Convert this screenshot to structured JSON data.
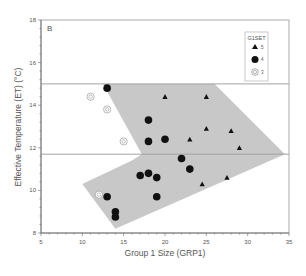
{
  "chart_data": {
    "type": "scatter",
    "panel_label": "B",
    "title": "",
    "xlabel": "Group 1 Size (GRP1)",
    "ylabel": "Effective Temperature (ET) (°C)",
    "xlim": [
      5,
      35
    ],
    "ylim": [
      8,
      18
    ],
    "x_ticks": [
      5,
      10,
      15,
      20,
      25,
      30,
      35
    ],
    "y_ticks": [
      8,
      10,
      12,
      14,
      16,
      18
    ],
    "grid": false,
    "reference_lines_y": [
      15,
      11.7
    ],
    "legend": {
      "title": "G1SET",
      "position": "upper right",
      "entries": [
        {
          "label": "5",
          "marker": "triangle"
        },
        {
          "label": "4",
          "marker": "filled-circle"
        },
        {
          "label": "3",
          "marker": "target-circle"
        }
      ]
    },
    "shaded_regions": [
      {
        "name": "upper-region",
        "points": [
          [
            12.5,
            15
          ],
          [
            26,
            15
          ],
          [
            34.5,
            11.7
          ],
          [
            17.2,
            11.7
          ]
        ]
      },
      {
        "name": "lower-region",
        "points": [
          [
            10,
            10.3
          ],
          [
            14,
            8.2
          ],
          [
            34.5,
            11.7
          ],
          [
            17.2,
            11.7
          ],
          [
            16,
            11.4
          ]
        ]
      }
    ],
    "series": [
      {
        "name": "5",
        "marker": "triangle",
        "points": [
          [
            20,
            14.4
          ],
          [
            25,
            14.4
          ],
          [
            25,
            12.9
          ],
          [
            28,
            12.8
          ],
          [
            23,
            12.4
          ],
          [
            29,
            12.0
          ],
          [
            27.5,
            10.6
          ],
          [
            24.5,
            10.3
          ]
        ]
      },
      {
        "name": "4",
        "marker": "filled-circle",
        "points": [
          [
            13,
            14.8
          ],
          [
            18,
            13.3
          ],
          [
            18,
            12.3
          ],
          [
            20,
            12.4
          ],
          [
            22,
            11.5
          ],
          [
            23,
            11.0
          ],
          [
            17,
            10.7
          ],
          [
            18,
            10.8
          ],
          [
            19,
            10.6
          ],
          [
            13,
            9.7
          ],
          [
            19,
            9.7
          ],
          [
            14,
            9.0
          ],
          [
            14,
            8.75
          ]
        ]
      },
      {
        "name": "3",
        "marker": "target-circle",
        "points": [
          [
            11,
            14.4
          ],
          [
            13,
            13.8
          ],
          [
            15,
            12.3
          ],
          [
            12,
            9.8
          ]
        ]
      }
    ]
  }
}
